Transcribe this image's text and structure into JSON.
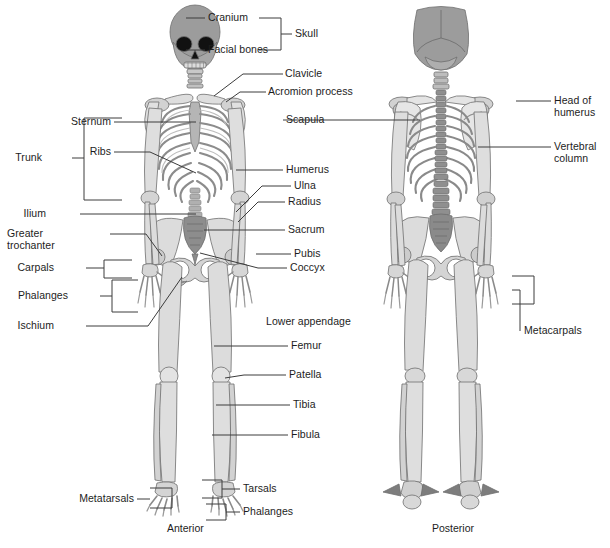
{
  "figure": {
    "captions": [
      {
        "id": "anterior",
        "text": "Anterior",
        "x": 167,
        "y": 528
      },
      {
        "id": "posterior",
        "text": "Posterior",
        "x": 432,
        "y": 528
      }
    ],
    "colors": {
      "bone_light": "#e3e3e3",
      "bone_mid": "#c9c9c9",
      "bone_dark": "#9a9a9a",
      "bone_darker": "#7d7d7d",
      "outline": "#6e6e6e",
      "skull_fill": "#9a9a9a",
      "eye_socket": "#111111",
      "leader_line": "#3c3c3c",
      "text": "#1d1d1d",
      "background": "#ffffff"
    }
  },
  "labels": {
    "left_column": [
      {
        "id": "cranium",
        "text": "Cranium",
        "x": 208,
        "y": 18,
        "align": "left"
      },
      {
        "id": "facial-bones",
        "text": "Facial bones",
        "x": 208,
        "y": 50,
        "align": "left"
      },
      {
        "id": "sternum",
        "text": "Sternum",
        "x": 111,
        "y": 122,
        "align": "right"
      },
      {
        "id": "ribs",
        "text": "Ribs",
        "x": 111,
        "y": 152,
        "align": "right"
      },
      {
        "id": "trunk",
        "text": "Trunk",
        "x": 42,
        "y": 158,
        "align": "right"
      },
      {
        "id": "ilium",
        "text": "Ilium",
        "x": 46,
        "y": 214,
        "align": "right"
      },
      {
        "id": "greater-trochanter",
        "text": "Greater\ntrochanter",
        "x": 46,
        "y": 240,
        "align": "left"
      },
      {
        "id": "carpals",
        "text": "Carpals",
        "x": 54,
        "y": 268,
        "align": "right"
      },
      {
        "id": "phalanges-hand",
        "text": "Phalanges",
        "x": 68,
        "y": 296,
        "align": "right"
      },
      {
        "id": "ischium",
        "text": "Ischium",
        "x": 54,
        "y": 326,
        "align": "right"
      },
      {
        "id": "metatarsals",
        "text": "Metatarsals",
        "x": 134,
        "y": 499,
        "align": "right"
      }
    ],
    "center_column": [
      {
        "id": "skull",
        "text": "Skull",
        "x": 295,
        "y": 34
      },
      {
        "id": "clavicle",
        "text": "Clavicle",
        "x": 285,
        "y": 74
      },
      {
        "id": "acrominon-process",
        "text": "Acromion process",
        "x": 268,
        "y": 92
      },
      {
        "id": "scapula",
        "text": "Scapula",
        "x": 286,
        "y": 120
      },
      {
        "id": "humerus",
        "text": "Humerus",
        "x": 286,
        "y": 170
      },
      {
        "id": "ulna",
        "text": "Ulna",
        "x": 294,
        "y": 186
      },
      {
        "id": "radius",
        "text": "Radius",
        "x": 288,
        "y": 202
      },
      {
        "id": "sacrum",
        "text": "Sacrum",
        "x": 288,
        "y": 230
      },
      {
        "id": "pubis",
        "text": "Pubis",
        "x": 294,
        "y": 254
      },
      {
        "id": "coccyx",
        "text": "Coccyx",
        "x": 290,
        "y": 268
      },
      {
        "id": "lower-appendage",
        "text": "Lower appendage",
        "x": 266,
        "y": 322
      },
      {
        "id": "femur",
        "text": "Femur",
        "x": 291,
        "y": 346
      },
      {
        "id": "patella",
        "text": "Patella",
        "x": 289,
        "y": 375
      },
      {
        "id": "tibia",
        "text": "Tibia",
        "x": 293,
        "y": 405
      },
      {
        "id": "fibula",
        "text": "Fibula",
        "x": 291,
        "y": 435
      },
      {
        "id": "tarsals",
        "text": "Tarsals",
        "x": 243,
        "y": 489
      },
      {
        "id": "phalanges-foot",
        "text": "Phalanges",
        "x": 243,
        "y": 512
      }
    ],
    "right_column": [
      {
        "id": "head-of-humerus",
        "text": "Head of\nhumerus",
        "x": 554,
        "y": 101
      },
      {
        "id": "vertebral-column",
        "text": "Vertebral\ncolumn",
        "x": 554,
        "y": 147
      },
      {
        "id": "metacarpals",
        "text": "Metacarpals",
        "x": 524,
        "y": 331
      }
    ]
  },
  "brackets": [
    {
      "id": "skull-bracket",
      "for": "Skull"
    },
    {
      "id": "trunk-bracket",
      "for": "Trunk"
    },
    {
      "id": "carpals-bracket",
      "for": "Carpals"
    },
    {
      "id": "phalanges-bracket",
      "for": "Phalanges"
    },
    {
      "id": "metatarsals-bracket",
      "for": "Metatarsals"
    },
    {
      "id": "tarsals-bracket",
      "for": "Tarsals"
    },
    {
      "id": "phalanges-foot-bracket",
      "for": "Phalanges"
    },
    {
      "id": "metacarpals-bracket",
      "for": "Metacarpals"
    }
  ]
}
